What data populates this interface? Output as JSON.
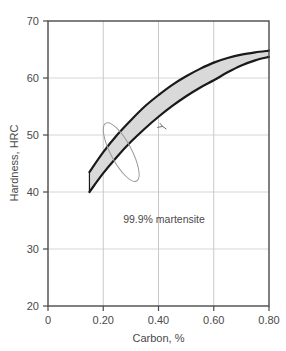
{
  "chart_data": {
    "type": "area",
    "title": "",
    "xlabel": "Carbon, %",
    "ylabel": "Hardness, HRC",
    "xlim": [
      0,
      0.8
    ],
    "ylim": [
      20,
      70
    ],
    "grid": true,
    "legend_position": "none",
    "xticks": [
      0,
      0.2,
      0.4,
      0.6,
      0.8
    ],
    "xtick_labels": [
      "0",
      "0.20",
      "0.40",
      "0.60",
      "0.80"
    ],
    "yticks": [
      20,
      30,
      40,
      50,
      60,
      70
    ],
    "ytick_labels": [
      "20",
      "30",
      "40",
      "50",
      "60",
      "70"
    ],
    "annotations": [
      {
        "text": "99.9% martensite",
        "x": 0.42,
        "y": 34.5
      }
    ],
    "band": {
      "name": "99.9% martensite hardness band",
      "fill_color": "#d9d9d9",
      "edge_color": "#1a1a1a",
      "x": [
        0.15,
        0.2,
        0.25,
        0.3,
        0.35,
        0.4,
        0.45,
        0.5,
        0.55,
        0.6,
        0.65,
        0.7,
        0.75,
        0.8
      ],
      "upper": [
        43.5,
        47.0,
        50.0,
        52.6,
        55.0,
        57.0,
        58.8,
        60.3,
        61.6,
        62.7,
        63.5,
        64.1,
        64.5,
        64.8
      ],
      "lower": [
        40.0,
        43.3,
        46.2,
        48.8,
        51.1,
        53.2,
        55.1,
        56.8,
        58.3,
        59.6,
        61.0,
        62.2,
        63.1,
        63.7
      ]
    },
    "overlay_ellipse": {
      "name": "data-scatter-envelope",
      "center_x": 0.265,
      "center_y": 47.0,
      "width": 0.075,
      "height": 11.5,
      "rotation_deg": -28,
      "edge_color": "#9a9a9a",
      "fill_color": "none"
    },
    "overlay_mark": {
      "name": "hand-drawn-squiggle",
      "x": 0.415,
      "y": 51.5,
      "color": "#6f6f6f"
    }
  }
}
